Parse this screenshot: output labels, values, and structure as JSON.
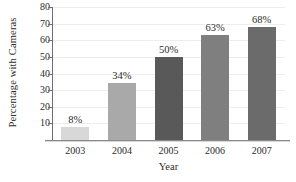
{
  "chart_data": {
    "type": "bar",
    "title": "",
    "xlabel": "Year",
    "ylabel": "Percentage with Cameras",
    "categories": [
      "2003",
      "2004",
      "2005",
      "2006",
      "2007"
    ],
    "values": [
      8,
      34,
      50,
      63,
      68
    ],
    "value_labels": [
      "8%",
      "34%",
      "50%",
      "63%",
      "68%"
    ],
    "bar_colors": [
      "#d8d8d8",
      "#a9a9a9",
      "#595959",
      "#7f7f7f",
      "#6b6b6b"
    ],
    "ylim": [
      0,
      80
    ],
    "yticks": [
      10,
      20,
      30,
      40,
      50,
      60,
      70,
      80
    ],
    "ytick_labels": [
      "10",
      "20",
      "30",
      "40",
      "50",
      "60",
      "70",
      "80"
    ],
    "grid": true,
    "grid_color": "#ededed",
    "legend": null,
    "axis_color": "#6e6e6e",
    "background": "#ffffff"
  }
}
